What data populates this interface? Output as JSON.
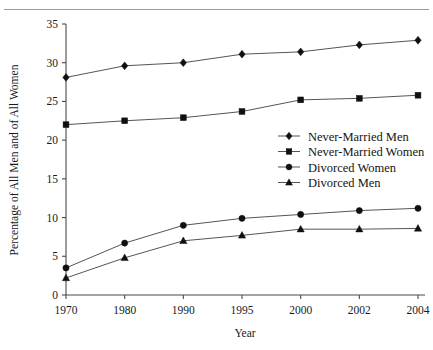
{
  "chart_data": {
    "type": "line",
    "title": "",
    "subtitle": "",
    "xlabel": "Year",
    "ylabel": "Percentage of All Men and of All Women",
    "categories": [
      "1970",
      "1980",
      "1990",
      "1995",
      "2000",
      "2002",
      "2004"
    ],
    "x_tick_labels": [
      "1970",
      "1980",
      "1990",
      "1995",
      "2000",
      "2002",
      "2004"
    ],
    "y_tick_labels": [
      "0",
      "5",
      "10",
      "15",
      "20",
      "25",
      "30",
      "35"
    ],
    "y_ticks": [
      0,
      5,
      10,
      15,
      20,
      25,
      30,
      35
    ],
    "ylim": [
      0,
      35
    ],
    "grid": false,
    "legend_position": "center-right",
    "series": [
      {
        "name": "Never-Married Men",
        "marker": "diamond",
        "color": "#101010",
        "values": [
          28.1,
          29.6,
          30.0,
          31.1,
          31.4,
          32.3,
          32.9
        ]
      },
      {
        "name": "Never-Married Women",
        "marker": "square",
        "color": "#101010",
        "values": [
          22.0,
          22.5,
          22.9,
          23.7,
          25.2,
          25.4,
          25.8
        ]
      },
      {
        "name": "Divorced Women",
        "marker": "circle",
        "color": "#101010",
        "values": [
          3.5,
          6.7,
          9.0,
          9.9,
          10.4,
          10.9,
          11.2
        ]
      },
      {
        "name": "Divorced Men",
        "marker": "triangle",
        "color": "#101010",
        "values": [
          2.2,
          4.8,
          7.0,
          7.7,
          8.5,
          8.5,
          8.6
        ]
      }
    ]
  },
  "legend": {
    "items": [
      {
        "label": "Never-Married Men",
        "marker": "diamond"
      },
      {
        "label": "Never-Married Women",
        "marker": "square"
      },
      {
        "label": "Divorced Women",
        "marker": "circle"
      },
      {
        "label": "Divorced Men",
        "marker": "triangle"
      }
    ]
  },
  "axes": {
    "x_title": "Year",
    "y_title": "Percentage of All Men and of All Women"
  }
}
